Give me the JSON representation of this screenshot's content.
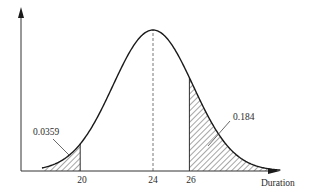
{
  "chart_data": {
    "type": "area",
    "title": "",
    "subtitle": "Normal distribution of project duration",
    "xlabel": "Duration",
    "ylabel": "",
    "distribution": {
      "mean": 24,
      "std_dev": 2.2
    },
    "x_ticks": [
      "20",
      "24",
      "26"
    ],
    "x_tick_values": [
      20,
      24,
      26
    ],
    "xlim": [
      17.5,
      31
    ],
    "grid": false,
    "legend": "none",
    "mean_line": {
      "x": 24,
      "style": "dashed"
    },
    "shaded_regions": [
      {
        "name": "left-tail",
        "from": 17.5,
        "to": 20,
        "label": "0.0359",
        "fill": "hatched"
      },
      {
        "name": "right-tail",
        "from": 26,
        "to": 30.5,
        "label": "0.184",
        "fill": "hatched"
      }
    ],
    "annotations": [
      {
        "text": "0.0359",
        "target": "left-tail"
      },
      {
        "text": "0.184",
        "target": "right-tail"
      }
    ]
  },
  "labels": {
    "x_axis": "Duration",
    "tick_20": "20",
    "tick_24": "24",
    "tick_26": "26",
    "left_prob": "0.0359",
    "right_prob": "0.184"
  },
  "colors": {
    "line": "#1a1a1a",
    "hatch": "#3a3a3a",
    "background": "#ffffff"
  }
}
